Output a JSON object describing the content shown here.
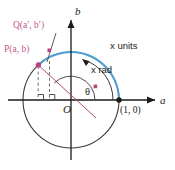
{
  "figure": {
    "colors": {
      "arc_blue": "#4f9fd4",
      "point_magenta": "#b5447f",
      "line_magenta": "#b5447f",
      "circle_black": "#3a3a3a",
      "axis_black": "#1a1a1a",
      "dash_gray": "#6b6b6b"
    },
    "axes": {
      "horizontal_label": "a",
      "vertical_label": "b",
      "origin_label": "O"
    },
    "labels": {
      "point_q": "Q(a′, b′)",
      "point_p": "P(a, b)",
      "arc_length": "x units",
      "angle_radians": "x rad",
      "angle_theta": "θ",
      "point_one_zero": "(1, 0)"
    },
    "geometry": {
      "origin_x": 71,
      "origin_y": 100,
      "radius": 48,
      "point_p_angle_deg": 133,
      "point_one_zero_x": 119,
      "point_one_zero_y": 100
    }
  }
}
